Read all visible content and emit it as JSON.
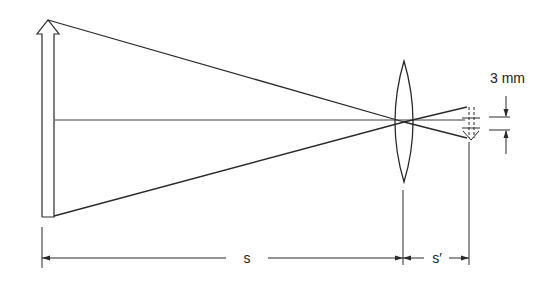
{
  "diagram": {
    "title": "",
    "labels": {
      "object_distance": "s",
      "image_distance": "s′",
      "image_size": "3 mm"
    },
    "colors": {
      "stroke": "#2a2a2a",
      "background": "#ffffff"
    }
  }
}
